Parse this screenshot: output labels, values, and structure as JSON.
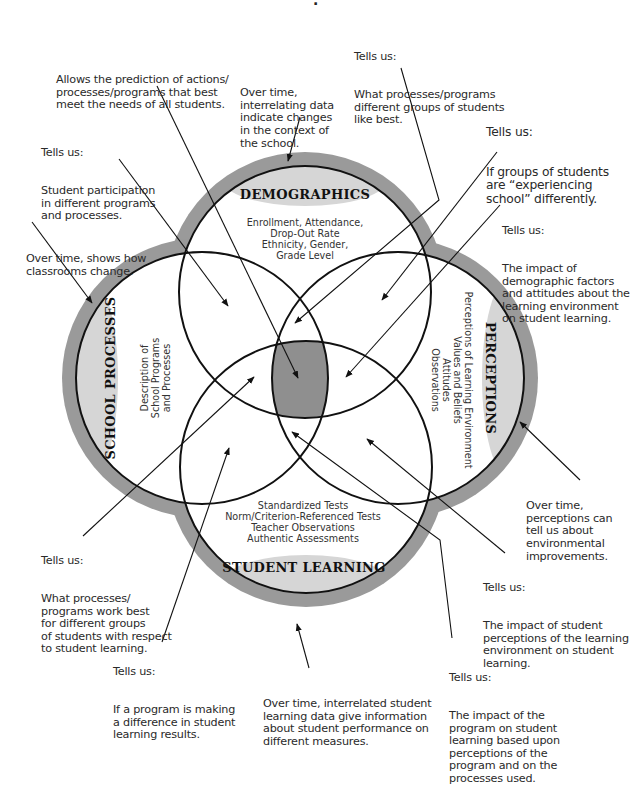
{
  "diagram": {
    "title_fragment": ".",
    "colors": {
      "ring": "#9a9a9a",
      "label_ellipse": "#d6d6d6",
      "center_overlap": "#8f8f8f",
      "stroke": "#111111",
      "background": "#ffffff"
    },
    "circles": {
      "demographics": {
        "title": "DEMOGRAPHICS",
        "body": [
          "Enrollment, Attendance,",
          "Drop-Out Rate",
          "Ethnicity, Gender,",
          "Grade Level"
        ]
      },
      "school_processes": {
        "title": "SCHOOL PROCESSES",
        "body": [
          "Description of",
          "School Programs",
          "and Processes"
        ]
      },
      "perceptions": {
        "title": "PERCEPTIONS",
        "body": [
          "Perceptions of Learning Environment",
          "Values and Beliefs",
          "Attitudes",
          "Observations"
        ]
      },
      "student_learning": {
        "title": "STUDENT LEARNING",
        "body": [
          "Standardized Tests",
          "Norm/Criterion-Referenced Tests",
          "Teacher Observations",
          "Authentic Assessments"
        ]
      }
    },
    "annotations": [
      {
        "id": "prediction",
        "head": "",
        "body": "Allows the prediction of actions/\nprocesses/programs that best\nmeet the needs of all students."
      },
      {
        "id": "demographics-over-time",
        "head": "",
        "body": "Over time,\ninterrelating data\nindicate changes\nin the context of\nthe school."
      },
      {
        "id": "programs-liked",
        "head": "Tells us:",
        "body": "What processes/programs\ndifferent groups of students\nlike best."
      },
      {
        "id": "experiencing-school",
        "head": "Tells us:",
        "body": "If groups of students\nare “experiencing\nschool” differently."
      },
      {
        "id": "participation",
        "head": "Tells us:",
        "body": "Student participation\nin different programs\nand processes."
      },
      {
        "id": "classrooms-change",
        "head": "",
        "body": "Over time, shows how\nclassrooms change."
      },
      {
        "id": "demographic-impact",
        "head": "Tells us:",
        "body": "The impact of\ndemographic factors\nand attitudes about the\nlearning environment\non student learning."
      },
      {
        "id": "perceptions-over-time",
        "head": "",
        "body": "Over time,\nperceptions can\ntell us about\nenvironmental\nimprovements."
      },
      {
        "id": "work-best",
        "head": "Tells us:",
        "body": "What processes/\nprograms work best\nfor different groups\nof students with respect\nto student learning."
      },
      {
        "id": "student-perceptions-impact",
        "head": "Tells us:",
        "body": "The impact of student\nperceptions of the learning\nenvironment on student\nlearning."
      },
      {
        "id": "program-difference",
        "head": "Tells us:",
        "body": "If a program is making\na difference in student\nlearning results."
      },
      {
        "id": "learning-over-time",
        "head": "",
        "body": "Over time, interrelated student\nlearning data give information\nabout student performance on\ndifferent measures."
      },
      {
        "id": "program-impact",
        "head": "Tells us:",
        "body": "The impact of the\nprogram on student\nlearning based upon\nperceptions of the\nprogram and on the\nprocesses used."
      }
    ]
  }
}
